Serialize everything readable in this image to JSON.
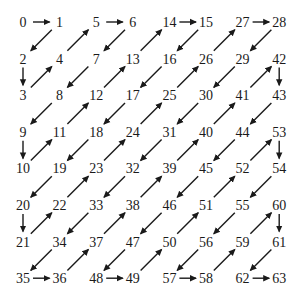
{
  "diagram": {
    "title": "",
    "colors": {
      "ink": "#1a1a1a",
      "background": "#ffffff"
    },
    "grid": [
      [
        0,
        1,
        5,
        6,
        14,
        15,
        27,
        28
      ],
      [
        2,
        4,
        7,
        13,
        16,
        26,
        29,
        42
      ],
      [
        3,
        8,
        12,
        17,
        25,
        30,
        41,
        43
      ],
      [
        9,
        11,
        18,
        24,
        31,
        40,
        44,
        53
      ],
      [
        10,
        19,
        23,
        32,
        39,
        45,
        52,
        54
      ],
      [
        20,
        22,
        33,
        38,
        46,
        51,
        55,
        60
      ],
      [
        21,
        34,
        37,
        47,
        50,
        56,
        59,
        61
      ],
      [
        35,
        36,
        48,
        49,
        57,
        58,
        62,
        63
      ]
    ]
  }
}
